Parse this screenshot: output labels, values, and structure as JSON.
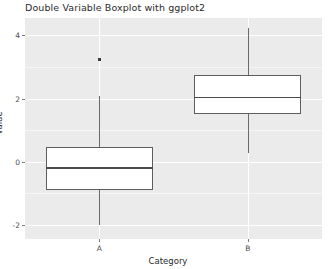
{
  "chart_data": {
    "type": "box",
    "title": "Double Variable Boxplot with ggplot2",
    "xlabel": "Category",
    "ylabel": "Value",
    "categories": [
      "A",
      "B"
    ],
    "yticks": [
      -2,
      0,
      2,
      4
    ],
    "ytick_labels": [
      "-2",
      "0",
      "2",
      "4"
    ],
    "ylim": [
      -2.45,
      4.55
    ],
    "grid": true,
    "legend": "none",
    "theme": "ggplot2-grey",
    "panel_color": "#ebebeb",
    "gridline_color": "#ffffff",
    "box_fill": "#ffffff",
    "box_line_color": "#5e5e5e",
    "boxes": [
      {
        "category": "A",
        "whisker_low": -2.0,
        "q1": -0.89,
        "median": -0.18,
        "q3": 0.46,
        "whisker_high": 2.09,
        "outliers": [
          3.23
        ]
      },
      {
        "category": "B",
        "whisker_low": 0.28,
        "q1": 1.51,
        "median": 2.06,
        "q3": 2.74,
        "whisker_high": 4.25,
        "outliers": []
      }
    ]
  }
}
